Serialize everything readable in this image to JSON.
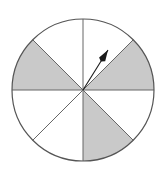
{
  "figure": {
    "name": "spinner-wheel",
    "background_color": "#ffffff"
  },
  "chart_data": {
    "type": "pie",
    "title": "",
    "subtitle": "",
    "xlabel": "",
    "ylabel": "",
    "grid": false,
    "legend_position": "none",
    "sector_count": 8,
    "sector_angle_degrees": 45,
    "categories": [
      "sector-1",
      "sector-2",
      "sector-3",
      "sector-4",
      "sector-5",
      "sector-6",
      "sector-7",
      "sector-8"
    ],
    "values": [
      45,
      45,
      45,
      45,
      45,
      45,
      45,
      45
    ],
    "sectors": [
      {
        "label": "sector-1",
        "start_deg": 0,
        "end_deg": 45,
        "fill": "#c9c9c9",
        "shaded": true
      },
      {
        "label": "sector-2",
        "start_deg": 45,
        "end_deg": 90,
        "fill": "#ffffff",
        "shaded": false
      },
      {
        "label": "sector-3",
        "start_deg": 90,
        "end_deg": 135,
        "fill": "#ffffff",
        "shaded": false
      },
      {
        "label": "sector-4",
        "start_deg": 135,
        "end_deg": 180,
        "fill": "#c9c9c9",
        "shaded": true
      },
      {
        "label": "sector-5",
        "start_deg": 180,
        "end_deg": 225,
        "fill": "#ffffff",
        "shaded": false
      },
      {
        "label": "sector-6",
        "start_deg": 225,
        "end_deg": 270,
        "fill": "#ffffff",
        "shaded": false
      },
      {
        "label": "sector-7",
        "start_deg": 270,
        "end_deg": 315,
        "fill": "#c9c9c9",
        "shaded": true
      },
      {
        "label": "sector-8",
        "start_deg": 315,
        "end_deg": 360,
        "fill": "#ffffff",
        "shaded": false
      }
    ],
    "shaded_count": 3,
    "unshaded_count": 5,
    "colors": {
      "shaded_fill": "#c9c9c9",
      "unshaded_fill": "#ffffff",
      "outline": "#555555",
      "divider": "#666666",
      "pointer": "#1a1a1a"
    },
    "geometry": {
      "center_x": 83,
      "center_y": 90,
      "radius": 71,
      "outline_width": 1.2
    },
    "pointer": {
      "name": "spinner-arrow",
      "angle_deg": 58,
      "tip_x": 108,
      "tip_y": 50,
      "tail_x": 83,
      "tail_y": 90,
      "landed_sector": "sector-2"
    }
  }
}
